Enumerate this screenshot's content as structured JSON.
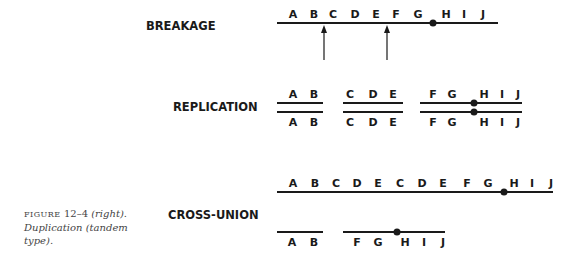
{
  "sections": {
    "breakage": {
      "title": "BREAKAGE",
      "labels": [
        "A",
        "B",
        "C",
        "D",
        "E",
        "F",
        "G",
        "H",
        "I",
        "J"
      ]
    },
    "replication": {
      "title": "REPLICATION",
      "segments": [
        {
          "labels": [
            "A",
            "B"
          ]
        },
        {
          "labels": [
            "C",
            "D",
            "E"
          ]
        },
        {
          "labels": [
            "F",
            "G",
            "H",
            "I",
            "J"
          ],
          "centromere_after": "G"
        }
      ]
    },
    "cross_union": {
      "title": "CROSS-UNION",
      "long_chromosome": [
        "A",
        "B",
        "C",
        "D",
        "E",
        "C",
        "D",
        "E",
        "F",
        "G",
        "H",
        "I",
        "J"
      ],
      "short_segments": [
        {
          "labels": [
            "A",
            "B"
          ]
        },
        {
          "labels": [
            "F",
            "G",
            "H",
            "I",
            "J"
          ],
          "centromere_after": "G"
        }
      ]
    }
  },
  "caption": {
    "figure_label": "FIGURE",
    "figure_number": "12–4",
    "position": "(right).",
    "text_line2": "Duplication (tandem",
    "text_line3": "type)."
  }
}
